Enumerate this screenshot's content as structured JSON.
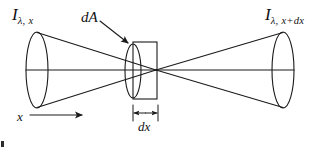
{
  "figure": {
    "type": "physics-diagram",
    "background_color": "#ffffff",
    "stroke_color": "#1a1a1a",
    "labels": {
      "intensity_in": {
        "symbol": "I",
        "subscript": "λ, x"
      },
      "intensity_out": {
        "symbol": "I",
        "subscript": "λ, x+dx"
      },
      "area_element": "dA",
      "axis": "x",
      "thickness": "dx"
    },
    "geometry": {
      "left_cone_ellipse": {
        "cx": 37,
        "cy": 70,
        "rx": 11,
        "ry": 38
      },
      "right_cone_ellipse": {
        "cx": 283,
        "cy": 70,
        "rx": 11,
        "ry": 38
      },
      "aperture_ellipse": {
        "cx": 133,
        "cy": 71,
        "rx": 8,
        "ry": 27
      },
      "slab_rect": {
        "x": 133,
        "y": 42,
        "width": 24,
        "height": 57
      },
      "apex": {
        "x": 156,
        "y": 70
      },
      "axis_line": {
        "x1": 26,
        "y1": 70,
        "x2": 294,
        "y2": 70
      },
      "dimension_line": {
        "x1": 133,
        "x2": 158,
        "y": 113
      },
      "x_arrow": {
        "x1": 30,
        "x2": 85,
        "y": 115
      },
      "da_arrow": {
        "x1": 100,
        "y1": 21,
        "x2": 129,
        "y2": 44
      }
    }
  }
}
